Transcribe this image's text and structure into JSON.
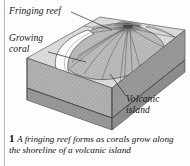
{
  "figure": {
    "labels": {
      "fringing_reef": "Fringing reef",
      "growing_coral": "Growing coral",
      "volcanic_island": "Volcanic island"
    },
    "caption": {
      "number": "1",
      "text": "A fringing reef forms as corals grow along the shoreline of a volcanic island"
    },
    "colors": {
      "sea_surface": "#d9d9d9",
      "upper_rock": "#a9a9a9",
      "lower_rock": "#8f8f8f",
      "island_flank": "#9a9a9a",
      "reef_highlight": "#fbfbfb",
      "outline": "#4a4a4a",
      "border_rule": "#b9b9b9",
      "background": "#fdfdfd"
    },
    "parts": [
      "sea-surface",
      "volcanic-island-cone",
      "lava-flow-lines",
      "fringing-reef-crescent",
      "block-front-face",
      "block-side-face",
      "rock-layer-boundary"
    ]
  }
}
